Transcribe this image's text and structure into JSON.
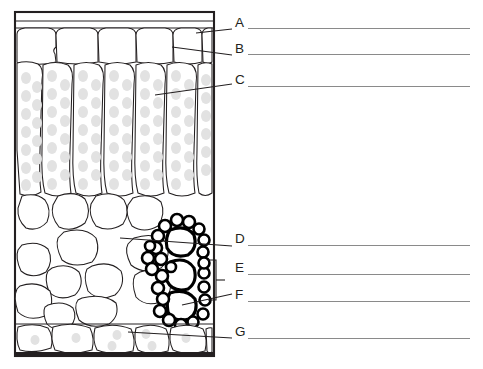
{
  "document": {
    "type": "labeled-diagram-worksheet",
    "subject": "leaf-cross-section",
    "background_color": "#ffffff",
    "ink_color": "#231f20",
    "answer_line_color": "#8a8a8a"
  },
  "diagram": {
    "name": "leaf-cross-section-diagram",
    "frame": {
      "x": 15,
      "y": 12,
      "width": 199,
      "height": 344
    },
    "layers": [
      {
        "id": "A",
        "name": "upper-cuticle-band",
        "description": "thin band at top of section"
      },
      {
        "id": "B",
        "name": "upper-epidermis-row",
        "description": "single row of squarish rounded cells",
        "cell_count": 6
      },
      {
        "id": "C",
        "name": "palisade-mesophyll-column",
        "description": "tall columnar cells containing chloroplast dots",
        "cell_count": 6
      },
      {
        "id": "D",
        "name": "spongy-mesophyll-region",
        "description": "irregular rounded cells with air spaces"
      },
      {
        "id": "E",
        "name": "vascular-bundle-upper",
        "description": "thick black outlined cells at right of spongy layer"
      },
      {
        "id": "F",
        "name": "vascular-bundle-lower",
        "description": "thick black outlined cells below E"
      },
      {
        "id": "G",
        "name": "lower-epidermis-row",
        "description": "bottom row of cells along lower border",
        "cell_count": 6
      }
    ]
  },
  "labels": [
    {
      "id": "A",
      "text": "A",
      "x": 235,
      "y": 16,
      "line_y": 28,
      "line_x1": 248,
      "line_x2": 470
    },
    {
      "id": "B",
      "text": "B",
      "x": 235,
      "y": 42,
      "line_y": 54,
      "line_x1": 248,
      "line_x2": 470
    },
    {
      "id": "C",
      "text": "C",
      "x": 235,
      "y": 73,
      "line_y": 86,
      "line_x1": 248,
      "line_x2": 470
    },
    {
      "id": "D",
      "text": "D",
      "x": 235,
      "y": 232,
      "line_y": 245,
      "line_x1": 248,
      "line_x2": 470
    },
    {
      "id": "E",
      "text": "E",
      "x": 235,
      "y": 261,
      "line_y": 274,
      "line_x1": 248,
      "line_x2": 470
    },
    {
      "id": "F",
      "text": "F",
      "x": 235,
      "y": 288,
      "line_y": 301,
      "line_x1": 248,
      "line_x2": 470
    },
    {
      "id": "G",
      "text": "G",
      "x": 235,
      "y": 325,
      "line_y": 338,
      "line_x1": 248,
      "line_x2": 470
    }
  ],
  "leader_lines": [
    {
      "for": "A",
      "from": [
        196,
        33
      ],
      "to": [
        232,
        29
      ]
    },
    {
      "for": "B",
      "from": [
        172,
        47
      ],
      "to": [
        232,
        55
      ]
    },
    {
      "for": "C",
      "from": [
        155,
        95
      ],
      "to": [
        232,
        84
      ]
    },
    {
      "for": "D",
      "from": [
        120,
        238
      ],
      "to": [
        232,
        246
      ]
    },
    {
      "for": "F",
      "from": [
        182,
        305
      ],
      "to": [
        232,
        294
      ]
    },
    {
      "for": "G",
      "from": [
        128,
        332
      ],
      "to": [
        232,
        338
      ]
    }
  ],
  "bracket": {
    "name": "e-f-bracket",
    "spans": [
      "E",
      "F"
    ],
    "x": 208,
    "y_top": 260,
    "y_bottom": 300,
    "tick_x": 222,
    "tick_y": 280
  }
}
